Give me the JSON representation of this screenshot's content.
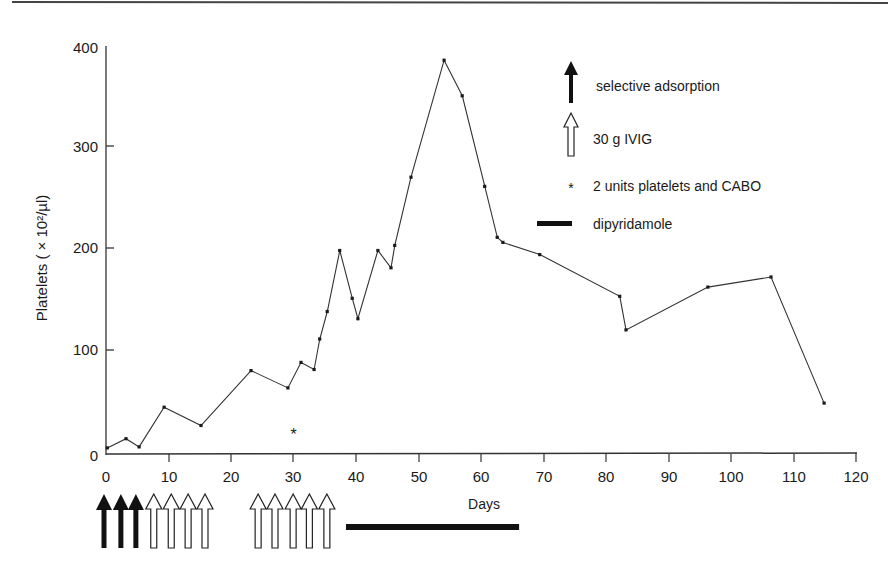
{
  "chart_data": {
    "type": "line",
    "title": "",
    "xlabel": "Days",
    "ylabel": "Platelets ( × 10²/µl)",
    "xlim": [
      0,
      120
    ],
    "ylim": [
      0,
      400
    ],
    "grid": false,
    "legend_position": "upper right",
    "x_ticks": [
      0,
      10,
      20,
      30,
      40,
      50,
      60,
      70,
      80,
      90,
      100,
      110,
      120
    ],
    "y_ticks": [
      0,
      100,
      200,
      300,
      400
    ],
    "series": [
      {
        "name": "Platelets",
        "x": [
          0.2,
          3.2,
          5.3,
          9.3,
          15.2,
          23.2,
          29.1,
          31.2,
          33.3,
          34.2,
          35.4,
          37.4,
          39.4,
          40.3,
          43.5,
          45.6,
          46.2,
          48.8,
          54.1,
          57.0,
          60.6,
          62.6,
          63.5,
          69.4,
          82.2,
          83.2,
          96.3,
          106.4,
          114.9
        ],
        "y": [
          6,
          15,
          7,
          46,
          28,
          82,
          65,
          90,
          83,
          113,
          140,
          200,
          153,
          133,
          200,
          183,
          205,
          272,
          387,
          352,
          263,
          213,
          208,
          196,
          155,
          122,
          164,
          174,
          50
        ]
      }
    ],
    "annotations": {
      "platelet_transfusion_marker": {
        "symbol": "*",
        "x": 30,
        "y": 20
      },
      "selective_adsorption_days": [
        0,
        2.7,
        5.1
      ],
      "ivig_days": [
        7.8,
        10.6,
        13.3,
        16.0,
        24.5,
        27.2,
        30.1,
        32.7,
        35.5
      ],
      "dipyridamole_range": [
        38.4,
        66.1
      ]
    },
    "legend": [
      {
        "symbol": "filled-arrow",
        "label": "selective adsorption"
      },
      {
        "symbol": "open-arrow",
        "label": "30 g IVIG"
      },
      {
        "symbol": "asterisk",
        "label": "2 units platelets and CABO"
      },
      {
        "symbol": "thick-bar",
        "label": "dipyridamole"
      }
    ]
  },
  "axis": {
    "ylabel": "Platelets ( × 10²/µl)",
    "xlabel": "Days",
    "x_tick_labels": [
      "0",
      "10",
      "20",
      "30",
      "40",
      "50",
      "60",
      "70",
      "80",
      "90",
      "100",
      "110",
      "120"
    ],
    "y_tick_labels": [
      "0",
      "100",
      "200",
      "300",
      "400"
    ]
  },
  "legend": {
    "selective_adsorption": "selective adsorption",
    "ivig": "30 g IVIG",
    "platelets_cabo": "2 units platelets and CABO",
    "dipyridamole": "dipyridamole",
    "asterisk_symbol": "*"
  },
  "colors": {
    "ink": "#1a1a1a",
    "line": "#333333",
    "background": "#ffffff"
  }
}
